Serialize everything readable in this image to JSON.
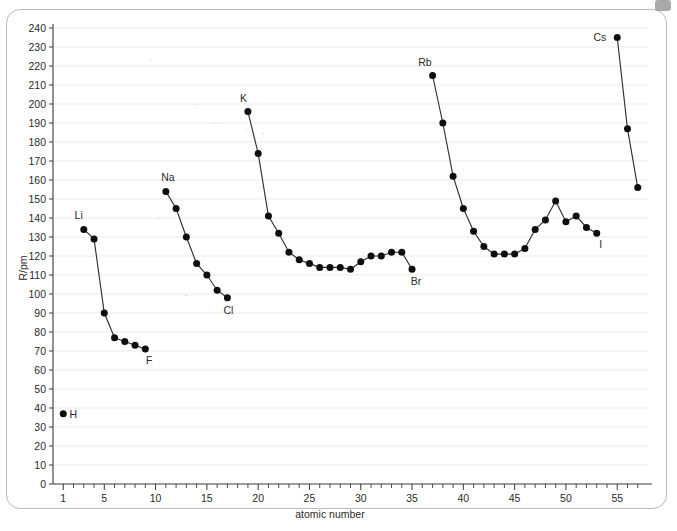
{
  "figure": {
    "icons": {
      "corner_tab": "corner-tab-icon"
    }
  },
  "axes": {
    "y_label": "R/pm",
    "x_label": "atomic number",
    "y_ticks": [
      0,
      10,
      20,
      30,
      40,
      50,
      60,
      70,
      80,
      90,
      100,
      110,
      120,
      130,
      140,
      150,
      160,
      170,
      180,
      190,
      200,
      210,
      220,
      230,
      240
    ],
    "x_ticks": [
      1,
      5,
      10,
      15,
      20,
      25,
      30,
      35,
      40,
      45,
      50,
      55
    ]
  },
  "chart_data": {
    "type": "line",
    "title": "",
    "xlabel": "atomic number",
    "ylabel": "R/pm",
    "xlim": [
      0,
      58
    ],
    "ylim": [
      0,
      240
    ],
    "grid": true,
    "legend": "none",
    "annotations": [
      {
        "text": "H",
        "x": 1,
        "y": 37
      },
      {
        "text": "Li",
        "x": 3,
        "y": 134
      },
      {
        "text": "F",
        "x": 9,
        "y": 71
      },
      {
        "text": "Na",
        "x": 11,
        "y": 154
      },
      {
        "text": "Cl",
        "x": 17,
        "y": 98
      },
      {
        "text": "K",
        "x": 19,
        "y": 196
      },
      {
        "text": "Br",
        "x": 35,
        "y": 113
      },
      {
        "text": "Rb",
        "x": 37,
        "y": 215
      },
      {
        "text": "I",
        "x": 53,
        "y": 132
      },
      {
        "text": "Cs",
        "x": 55,
        "y": 235
      }
    ],
    "series": [
      {
        "name": "hydrogen",
        "x": [
          1
        ],
        "values": [
          37
        ]
      },
      {
        "name": "period-2",
        "x": [
          3,
          4,
          5,
          6,
          7,
          8,
          9
        ],
        "values": [
          134,
          129,
          90,
          77,
          75,
          73,
          71
        ]
      },
      {
        "name": "period-3",
        "x": [
          11,
          12,
          13,
          14,
          15,
          16,
          17
        ],
        "values": [
          154,
          145,
          130,
          116,
          110,
          102,
          98
        ]
      },
      {
        "name": "period-4",
        "x": [
          19,
          20,
          21,
          22,
          23,
          24,
          25,
          26,
          27,
          28,
          29,
          30,
          31,
          32,
          33,
          34,
          35
        ],
        "values": [
          196,
          174,
          141,
          132,
          122,
          118,
          116,
          114,
          114,
          114,
          113,
          117,
          120,
          120,
          122,
          122,
          113
        ]
      },
      {
        "name": "period-5",
        "x": [
          37,
          38,
          39,
          40,
          41,
          42,
          43,
          44,
          45,
          46,
          47,
          48,
          49,
          50,
          51,
          52,
          53
        ],
        "values": [
          215,
          190,
          162,
          145,
          133,
          125,
          121,
          121,
          121,
          124,
          134,
          139,
          149,
          138,
          141,
          135,
          132
        ]
      },
      {
        "name": "period-6",
        "x": [
          55,
          56,
          57
        ],
        "values": [
          235,
          187,
          156
        ]
      }
    ]
  }
}
